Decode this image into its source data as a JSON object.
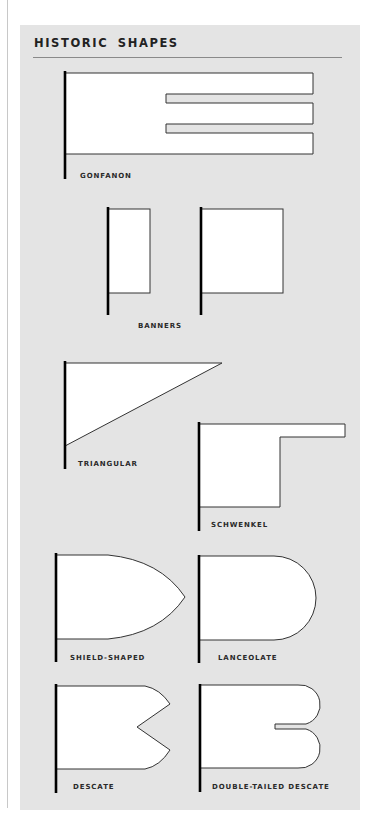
{
  "header": {
    "title": "HISTORIC SHAPES"
  },
  "shapes": [
    {
      "id": "gonfanon",
      "label": "GONFANON"
    },
    {
      "id": "banners",
      "label": "BANNERS"
    },
    {
      "id": "triangular",
      "label": "TRIANGULAR"
    },
    {
      "id": "schwenkel",
      "label": "SCHWENKEL"
    },
    {
      "id": "shield-shaped",
      "label": "SHIELD-SHAPED"
    },
    {
      "id": "lanceolate",
      "label": "LANCEOLATE"
    },
    {
      "id": "descate",
      "label": "DESCATE"
    },
    {
      "id": "double-tailed-descate",
      "label": "DOUBLE-TAILED DESCATE"
    }
  ],
  "colors": {
    "panel": "#e4e4e4",
    "flag_fill": "#ffffff",
    "outline": "#333333",
    "pole": "#000000"
  }
}
